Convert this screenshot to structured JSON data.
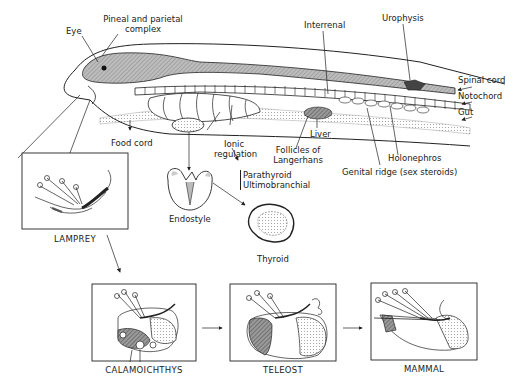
{
  "figure": {
    "main_labels": {
      "eye": "Eye",
      "pineal": "Pineal and parietal complex",
      "pineal_line1": "Pineal and parietal",
      "pineal_line2": "complex",
      "interrenal": "Interrenal",
      "urophysis": "Urophysis",
      "spinal_cord": "Spinal cord",
      "notochord": "Notochord",
      "gut": "Gut",
      "food_cord": "Food cord",
      "ionic_line1": "Ionic",
      "ionic_line2": "regulation",
      "parathyroid": "Parathyroid",
      "ultimobranchial": "Ultimobranchial",
      "liver": "Liver",
      "follicles_line1": "Follicles of",
      "follicles_line2": "Langerhans",
      "holonephros": "Holonephros",
      "genital_ridge": "Genital ridge (sex steroids)",
      "endostyle": "Endostyle",
      "thyroid": "Thyroid"
    },
    "panels": [
      {
        "id": "lamprey",
        "caption": "LAMPREY"
      },
      {
        "id": "calamoichthys",
        "caption": "CALAMOICHTHYS"
      },
      {
        "id": "teleost",
        "caption": "TELEOST"
      },
      {
        "id": "mammal",
        "caption": "MAMMAL"
      }
    ]
  }
}
